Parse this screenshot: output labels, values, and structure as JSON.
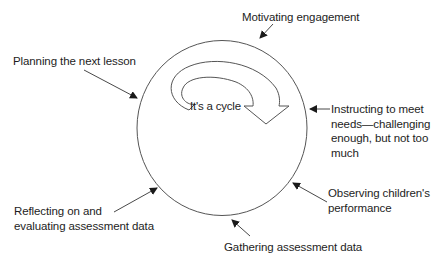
{
  "diagram": {
    "title": "",
    "center_text": "It's a cycle",
    "stages": [
      {
        "id": "motivating",
        "label": "Motivating engagement",
        "position": "top"
      },
      {
        "id": "instructing",
        "label_lines": [
          "Instructing to meet",
          "needs—challenging",
          "enough, but not too",
          "much"
        ],
        "position": "right"
      },
      {
        "id": "observing",
        "label_lines": [
          "Observing children's",
          "performance"
        ],
        "position": "lower-right"
      },
      {
        "id": "gathering",
        "label": "Gathering assessment data",
        "position": "bottom"
      },
      {
        "id": "reflecting",
        "label_lines": [
          "Reflecting on and",
          "evaluating assessment data"
        ],
        "position": "lower-left"
      },
      {
        "id": "planning",
        "label": "Planning the next lesson",
        "position": "upper-left"
      }
    ],
    "colors": {
      "line": "#555555",
      "arrow": "#1a1a1a",
      "text": "#1d1d1d",
      "background": "#ffffff"
    }
  }
}
